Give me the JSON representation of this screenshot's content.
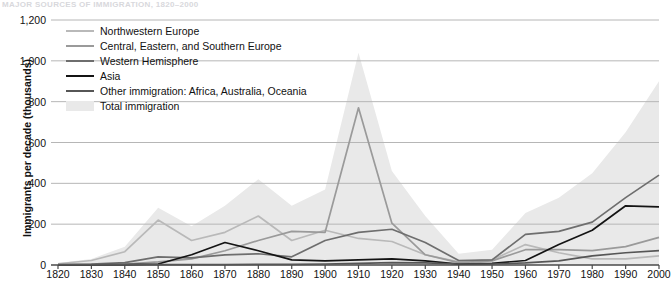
{
  "chart_title": "Major Sources of Immigration, 1820–2000",
  "axes": {
    "ylabel": "Immigrants per decade (thousands)",
    "xlabel": "",
    "yticks": [
      "0",
      "200",
      "400",
      "600",
      "800",
      "1,000",
      "1,200"
    ],
    "ylim": [
      0,
      1200
    ],
    "xticks": [
      "1820",
      "1830",
      "1840",
      "1850",
      "1860",
      "1870",
      "1880",
      "1890",
      "1900",
      "1910",
      "1920",
      "1930",
      "1940",
      "1950",
      "1960",
      "1970",
      "1980",
      "1990",
      "2000"
    ],
    "xlim": [
      1820,
      2000
    ],
    "grid": "horizontal"
  },
  "colors": {
    "northwestern_europe": "#b9b9b9",
    "central_eastern_southern_europe": "#9a9a9a",
    "western_hemisphere": "#6e6e6e",
    "asia": "#141414",
    "other": "#565656",
    "total_area": "#e9e9e9",
    "gridline": "#b6b6b6",
    "axis": "#4a4a4a",
    "title": "#d8d8dc"
  },
  "legend": {
    "position": "top-left",
    "items": [
      {
        "label": "Northwestern Europe",
        "type": "line",
        "color_key": "northwestern_europe"
      },
      {
        "label": "Central, Eastern, and Southern Europe",
        "type": "line",
        "color_key": "central_eastern_southern_europe"
      },
      {
        "label": "Western Hemisphere",
        "type": "line",
        "color_key": "western_hemisphere"
      },
      {
        "label": "Asia",
        "type": "line",
        "color_key": "asia"
      },
      {
        "label": "Other immigration: Africa, Australia, Oceania",
        "type": "line",
        "color_key": "other"
      },
      {
        "label": "Total immigration",
        "type": "area",
        "color_key": "total_area"
      }
    ]
  },
  "chart_data": {
    "type": "area",
    "title": "Major Sources of Immigration, 1820–2000",
    "xlabel": "",
    "ylabel": "Immigrants per decade (thousands)",
    "ylim": [
      0,
      1200
    ],
    "xlim": [
      1820,
      2000
    ],
    "grid": true,
    "legend_position": "top-left",
    "x": [
      1820,
      1830,
      1840,
      1850,
      1860,
      1870,
      1880,
      1890,
      1900,
      1910,
      1920,
      1930,
      1940,
      1950,
      1960,
      1970,
      1980,
      1990,
      2000
    ],
    "series": [
      {
        "name": "Total immigration",
        "render": "area",
        "color": "#e9e9e9",
        "values": [
          10,
          30,
          90,
          280,
          190,
          290,
          420,
          290,
          370,
          1040,
          460,
          240,
          55,
          75,
          255,
          330,
          450,
          650,
          900
        ]
      },
      {
        "name": "Northwestern Europe",
        "render": "line",
        "color": "#b9b9b9",
        "values": [
          6,
          22,
          65,
          220,
          120,
          160,
          240,
          120,
          170,
          130,
          115,
          50,
          15,
          25,
          100,
          60,
          30,
          30,
          45
        ]
      },
      {
        "name": "Central, Eastern, and Southern Europe",
        "render": "line",
        "color": "#9a9a9a",
        "values": [
          2,
          3,
          5,
          15,
          30,
          70,
          120,
          165,
          160,
          770,
          205,
          50,
          12,
          20,
          75,
          75,
          70,
          90,
          135
        ]
      },
      {
        "name": "Western Hemisphere",
        "render": "line",
        "color": "#6e6e6e",
        "values": [
          2,
          5,
          12,
          40,
          35,
          50,
          55,
          40,
          120,
          160,
          175,
          110,
          22,
          25,
          150,
          165,
          210,
          330,
          440
        ]
      },
      {
        "name": "Asia",
        "render": "line",
        "color": "#141414",
        "values": [
          1,
          1,
          2,
          5,
          50,
          110,
          70,
          25,
          20,
          25,
          30,
          20,
          5,
          8,
          22,
          100,
          170,
          290,
          285
        ]
      },
      {
        "name": "Other immigration: Africa, Australia, Oceania",
        "render": "line",
        "color": "#565656",
        "values": [
          1,
          1,
          1,
          2,
          2,
          2,
          3,
          3,
          5,
          8,
          12,
          10,
          5,
          5,
          10,
          20,
          45,
          60,
          70
        ]
      }
    ]
  }
}
